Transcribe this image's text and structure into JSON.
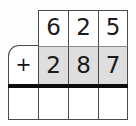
{
  "worksheet": {
    "type": "vertical-addition-problem",
    "operator": "+",
    "columns": 3,
    "rows": [
      {
        "name": "addend-row-1",
        "shaded": false,
        "digits": [
          "6",
          "2",
          "5"
        ],
        "value": "625"
      },
      {
        "name": "addend-row-2",
        "shaded": true,
        "digits": [
          "2",
          "8",
          "7"
        ],
        "value": "287"
      },
      {
        "name": "answer-row",
        "shaded": false,
        "digits": [
          "",
          "",
          ""
        ],
        "value": ""
      }
    ],
    "colors": {
      "grid_line": "#4a4a4a",
      "sum_bar": "#0d0d0d",
      "shaded_cell": "#dedede",
      "cell_background": "#ffffff",
      "page_background": "#fdfdfd",
      "digit": "#1a1a1a"
    }
  }
}
